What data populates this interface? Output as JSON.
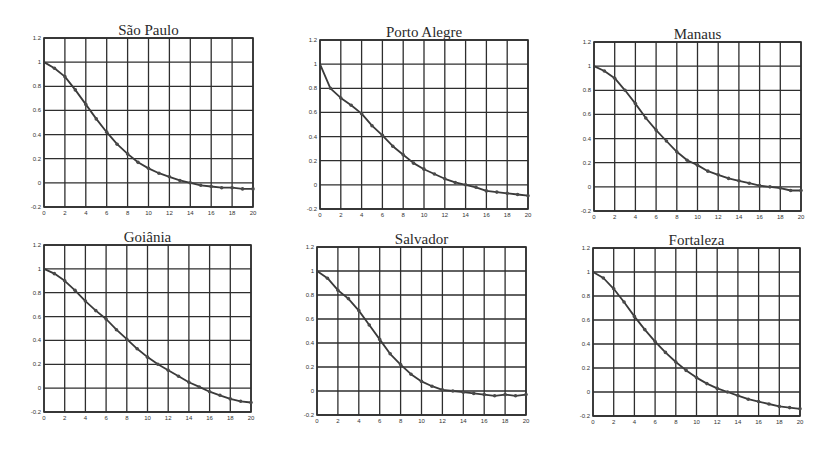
{
  "figure": {
    "background": "#ffffff",
    "line_color": "#3a3a3a",
    "grid_color": "#2e2e2e",
    "marker_color": "#4a4a4a"
  },
  "chart_data": [
    {
      "type": "line",
      "title": "São Paulo",
      "xlabel": "",
      "ylabel": "",
      "xlim": [
        0,
        20
      ],
      "ylim": [
        -0.2,
        1.2
      ],
      "xticks": [
        0,
        2,
        4,
        6,
        8,
        10,
        12,
        14,
        16,
        18,
        20
      ],
      "yticks": [
        -0.2,
        0,
        0.2,
        0.4,
        0.6,
        0.8,
        1,
        1.2
      ],
      "ytick_labels": [
        "-0.2",
        "0",
        "0.2",
        "0.4",
        "0.6",
        "0.8",
        "1",
        "1.2"
      ],
      "grid": true,
      "x": [
        0,
        1,
        2,
        3,
        4,
        5,
        6,
        7,
        8,
        9,
        10,
        11,
        12,
        13,
        14,
        15,
        16,
        17,
        18,
        19,
        20
      ],
      "values": [
        1.0,
        0.95,
        0.88,
        0.77,
        0.65,
        0.53,
        0.42,
        0.32,
        0.24,
        0.17,
        0.12,
        0.08,
        0.05,
        0.02,
        0.0,
        -0.02,
        -0.03,
        -0.04,
        -0.04,
        -0.05,
        -0.05
      ],
      "frame": {
        "left": 44,
        "top": 38,
        "right": 253,
        "bottom": 207
      }
    },
    {
      "type": "line",
      "title": "Porto Alegre",
      "xlabel": "",
      "ylabel": "",
      "xlim": [
        0,
        20
      ],
      "ylim": [
        -0.2,
        1.2
      ],
      "xticks": [
        0,
        2,
        4,
        6,
        8,
        10,
        12,
        14,
        16,
        18,
        20
      ],
      "yticks": [
        -0.2,
        0,
        0.2,
        0.4,
        0.6,
        0.8,
        1,
        1.2
      ],
      "ytick_labels": [
        "-0.2",
        "0",
        "0.2",
        "0.4",
        "0.6",
        "0.8",
        "1",
        "1.2"
      ],
      "grid": true,
      "x": [
        0,
        1,
        2,
        3,
        4,
        5,
        6,
        7,
        8,
        9,
        10,
        11,
        12,
        13,
        14,
        15,
        16,
        17,
        18,
        19,
        20
      ],
      "values": [
        1.0,
        0.8,
        0.72,
        0.66,
        0.59,
        0.49,
        0.41,
        0.32,
        0.25,
        0.18,
        0.13,
        0.09,
        0.05,
        0.02,
        0.0,
        -0.02,
        -0.05,
        -0.06,
        -0.07,
        -0.08,
        -0.09
      ],
      "frame": {
        "left": 320,
        "top": 40,
        "right": 528,
        "bottom": 209
      }
    },
    {
      "type": "line",
      "title": "Manaus",
      "xlabel": "",
      "ylabel": "",
      "xlim": [
        0,
        20
      ],
      "ylim": [
        -0.2,
        1.2
      ],
      "xticks": [
        0,
        2,
        4,
        6,
        8,
        10,
        12,
        14,
        16,
        18,
        20
      ],
      "yticks": [
        -0.2,
        0,
        0.2,
        0.4,
        0.6,
        0.8,
        1,
        1.2
      ],
      "ytick_labels": [
        "-0.2",
        "0",
        "0.2",
        "0.4",
        "0.6",
        "0.8",
        "1",
        "1.2"
      ],
      "grid": true,
      "x": [
        0,
        1,
        2,
        3,
        4,
        5,
        6,
        7,
        8,
        9,
        10,
        11,
        12,
        13,
        14,
        15,
        16,
        17,
        18,
        19,
        20
      ],
      "values": [
        1.0,
        0.96,
        0.9,
        0.8,
        0.69,
        0.57,
        0.47,
        0.38,
        0.29,
        0.22,
        0.18,
        0.13,
        0.1,
        0.07,
        0.05,
        0.03,
        0.01,
        0.0,
        -0.01,
        -0.03,
        -0.03
      ],
      "frame": {
        "left": 594,
        "top": 42,
        "right": 801,
        "bottom": 211
      }
    },
    {
      "type": "line",
      "title": "Goiânia",
      "xlabel": "",
      "ylabel": "",
      "xlim": [
        0,
        20
      ],
      "ylim": [
        -0.2,
        1.2
      ],
      "xticks": [
        0,
        2,
        4,
        6,
        8,
        10,
        12,
        14,
        16,
        18,
        20
      ],
      "yticks": [
        -0.2,
        0,
        0.2,
        0.4,
        0.6,
        0.8,
        1,
        1.2
      ],
      "ytick_labels": [
        "-0.2",
        "0",
        "0.2",
        "0.4",
        "0.6",
        "0.8",
        "1",
        "1.2"
      ],
      "grid": true,
      "x": [
        0,
        1,
        2,
        3,
        4,
        5,
        6,
        7,
        8,
        9,
        10,
        11,
        12,
        13,
        14,
        15,
        16,
        17,
        18,
        19,
        20
      ],
      "values": [
        1.0,
        0.96,
        0.9,
        0.82,
        0.73,
        0.65,
        0.58,
        0.49,
        0.41,
        0.33,
        0.26,
        0.2,
        0.15,
        0.1,
        0.05,
        0.01,
        -0.03,
        -0.06,
        -0.09,
        -0.11,
        -0.12
      ],
      "frame": {
        "left": 44,
        "top": 245,
        "right": 251,
        "bottom": 412
      }
    },
    {
      "type": "line",
      "title": "Salvador",
      "xlabel": "",
      "ylabel": "",
      "xlim": [
        0,
        20
      ],
      "ylim": [
        -0.2,
        1.2
      ],
      "xticks": [
        0,
        2,
        4,
        6,
        8,
        10,
        12,
        14,
        16,
        18,
        20
      ],
      "yticks": [
        -0.2,
        0,
        0.2,
        0.4,
        0.6,
        0.8,
        1,
        1.2
      ],
      "ytick_labels": [
        "-0.2",
        "0",
        "0.2",
        "0.4",
        "0.6",
        "0.8",
        "1",
        "1.2"
      ],
      "grid": true,
      "x": [
        0,
        1,
        2,
        3,
        4,
        5,
        6,
        7,
        8,
        9,
        10,
        11,
        12,
        13,
        14,
        15,
        16,
        17,
        18,
        19,
        20
      ],
      "values": [
        1.0,
        0.94,
        0.84,
        0.77,
        0.67,
        0.55,
        0.43,
        0.31,
        0.22,
        0.14,
        0.08,
        0.04,
        0.01,
        0.0,
        -0.01,
        -0.02,
        -0.03,
        -0.04,
        -0.03,
        -0.04,
        -0.03
      ],
      "frame": {
        "left": 317,
        "top": 247,
        "right": 526,
        "bottom": 415
      }
    },
    {
      "type": "line",
      "title": "Fortaleza",
      "xlabel": "",
      "ylabel": "",
      "xlim": [
        0,
        20
      ],
      "ylim": [
        -0.2,
        1.2
      ],
      "xticks": [
        0,
        2,
        4,
        6,
        8,
        10,
        12,
        14,
        16,
        18,
        20
      ],
      "yticks": [
        -0.2,
        0,
        0.2,
        0.4,
        0.6,
        0.8,
        1,
        1.2
      ],
      "ytick_labels": [
        "-0.2",
        "0",
        "0.2",
        "0.4",
        "0.6",
        "0.8",
        "1",
        "1.2"
      ],
      "grid": true,
      "x": [
        0,
        1,
        2,
        3,
        4,
        5,
        6,
        7,
        8,
        9,
        10,
        11,
        12,
        13,
        14,
        15,
        16,
        17,
        18,
        19,
        20
      ],
      "values": [
        1.0,
        0.95,
        0.86,
        0.75,
        0.63,
        0.52,
        0.42,
        0.33,
        0.25,
        0.18,
        0.12,
        0.07,
        0.03,
        0.0,
        -0.03,
        -0.06,
        -0.08,
        -0.1,
        -0.12,
        -0.13,
        -0.14
      ],
      "frame": {
        "left": 593,
        "top": 248,
        "right": 800,
        "bottom": 416
      }
    }
  ]
}
